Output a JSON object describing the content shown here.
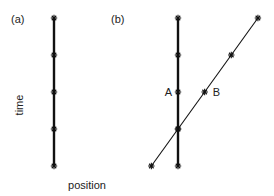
{
  "panels": [
    {
      "label": "(a)",
      "worldlines": [
        {
          "name": "stationary",
          "points": [
            [
              0,
              0
            ],
            [
              0,
              1
            ],
            [
              0,
              2
            ],
            [
              0,
              3
            ],
            [
              0,
              4
            ]
          ],
          "thick": true
        }
      ]
    },
    {
      "label": "(b)",
      "worldlines": [
        {
          "name": "stationary",
          "points": [
            [
              0,
              0
            ],
            [
              0,
              1
            ],
            [
              0,
              2
            ],
            [
              0,
              3
            ],
            [
              0,
              4
            ]
          ],
          "thick": true
        },
        {
          "name": "moving",
          "points": [
            [
              -0.36,
              0
            ],
            [
              0,
              1
            ],
            [
              0.36,
              2
            ],
            [
              0.72,
              3
            ],
            [
              1.08,
              4
            ]
          ],
          "thick": false
        }
      ],
      "event_labels": [
        {
          "text": "A",
          "line": 0,
          "index": 2,
          "side": "left"
        },
        {
          "text": "B",
          "line": 1,
          "index": 2,
          "side": "right"
        }
      ]
    }
  ],
  "axes": {
    "ylabel": "time",
    "xlabel": "position"
  },
  "colors": {
    "ink": "#111111",
    "background": "#ffffff"
  }
}
